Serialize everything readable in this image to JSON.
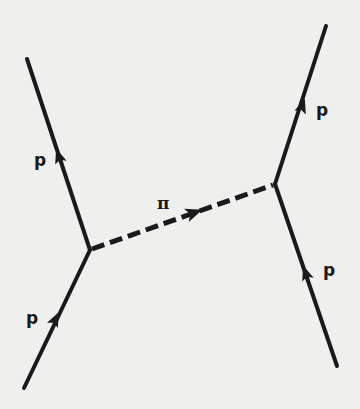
{
  "diagram": {
    "type": "feynman",
    "colors": {
      "background": "#efefed",
      "line": "#1a1a1a"
    },
    "vertices": [
      {
        "id": "v1",
        "x": 90,
        "y": 250
      },
      {
        "id": "v2",
        "x": 275,
        "y": 184
      }
    ],
    "lines": [
      {
        "id": "p-in-left",
        "style": "solid",
        "from": [
          24,
          388
        ],
        "to": [
          90,
          250
        ],
        "arrow_at": [
          55,
          320
        ],
        "label": "p"
      },
      {
        "id": "p-out-left",
        "style": "solid",
        "from": [
          90,
          250
        ],
        "to": [
          27,
          59
        ],
        "arrow_at": [
          59,
          157
        ],
        "label": "p"
      },
      {
        "id": "pion",
        "style": "dashed",
        "from": [
          90,
          250
        ],
        "to": [
          275,
          184
        ],
        "arrow_at": [
          193,
          213
        ],
        "label": "π"
      },
      {
        "id": "p-in-right",
        "style": "solid",
        "from": [
          337,
          366
        ],
        "to": [
          275,
          184
        ],
        "arrow_at": [
          306,
          274
        ],
        "label": "p"
      },
      {
        "id": "p-out-right",
        "style": "solid",
        "from": [
          275,
          184
        ],
        "to": [
          326,
          26
        ],
        "arrow_at": [
          302,
          107
        ],
        "label": "p"
      }
    ],
    "labels": {
      "p_top_left": "p",
      "p_bottom_left": "p",
      "pi": "π",
      "p_top_right": "p",
      "p_bottom_right": "p"
    }
  }
}
